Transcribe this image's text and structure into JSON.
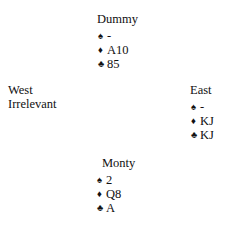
{
  "diagram": {
    "type": "bridge-hand-diagram",
    "background_color": "#ffffff",
    "text_color": "#111111"
  },
  "suit_symbols": {
    "spade": "♠",
    "heart": "♥",
    "diamond": "♦",
    "club": "♣"
  },
  "north": {
    "label": "Dummy",
    "suits": [
      {
        "symbol": "♠",
        "name": "spade",
        "cards": "-"
      },
      {
        "symbol": "♦",
        "name": "diamond",
        "cards": "A10"
      },
      {
        "symbol": "♣",
        "name": "club",
        "cards": "85"
      }
    ]
  },
  "west": {
    "label": "West",
    "note": "Irrelevant"
  },
  "east": {
    "label": "East",
    "suits": [
      {
        "symbol": "♠",
        "name": "spade",
        "cards": "-"
      },
      {
        "symbol": "♦",
        "name": "diamond",
        "cards": "KJ"
      },
      {
        "symbol": "♣",
        "name": "club",
        "cards": "KJ"
      }
    ]
  },
  "south": {
    "label": "Monty",
    "suits": [
      {
        "symbol": "♠",
        "name": "spade",
        "cards": "2"
      },
      {
        "symbol": "♦",
        "name": "diamond",
        "cards": "Q8"
      },
      {
        "symbol": "♣",
        "name": "club",
        "cards": "A"
      }
    ]
  }
}
